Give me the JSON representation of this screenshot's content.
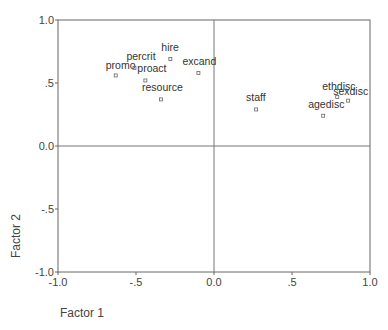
{
  "chart_data": {
    "type": "scatter",
    "title": "",
    "xlabel": "Factor 1",
    "ylabel": "Factor 2",
    "xlim": [
      -1.0,
      1.0
    ],
    "ylim": [
      -1.0,
      1.0
    ],
    "x_ticks": [
      {
        "value": -1.0,
        "label": "-1.0"
      },
      {
        "value": -0.5,
        "label": "-.5"
      },
      {
        "value": 0.0,
        "label": "0.0"
      },
      {
        "value": 0.5,
        "label": ".5"
      },
      {
        "value": 1.0,
        "label": "1.0"
      }
    ],
    "y_ticks": [
      {
        "value": 1.0,
        "label": "1.0"
      },
      {
        "value": 0.5,
        "label": ".5"
      },
      {
        "value": 0.0,
        "label": "0.0"
      },
      {
        "value": -0.5,
        "label": "-.5"
      },
      {
        "value": -1.0,
        "label": "-1.0"
      }
    ],
    "grid": false,
    "reference_lines": {
      "x": 0.0,
      "y": 0.0
    },
    "legend": null,
    "points": [
      {
        "label": "promo",
        "x": -0.63,
        "y": 0.56,
        "dx": -10,
        "dy": -6
      },
      {
        "label": "percrit",
        "x": -0.51,
        "y": 0.62,
        "dx": -8,
        "dy": -8
      },
      {
        "label": "proact",
        "x": -0.44,
        "y": 0.52,
        "dx": -8,
        "dy": -8
      },
      {
        "label": "hire",
        "x": -0.28,
        "y": 0.69,
        "dx": -9,
        "dy": -8
      },
      {
        "label": "excand",
        "x": -0.1,
        "y": 0.58,
        "dx": -16,
        "dy": -8
      },
      {
        "label": "resource",
        "x": -0.34,
        "y": 0.37,
        "dx": -19,
        "dy": -8
      },
      {
        "label": "staff",
        "x": 0.27,
        "y": 0.29,
        "dx": -10,
        "dy": -8
      },
      {
        "label": "ethdisc",
        "x": 0.79,
        "y": 0.39,
        "dx": -15,
        "dy": -7
      },
      {
        "label": "sexdisc",
        "x": 0.86,
        "y": 0.36,
        "dx": -15,
        "dy": -6
      },
      {
        "label": "agedisc",
        "x": 0.7,
        "y": 0.24,
        "dx": -15,
        "dy": -8
      }
    ]
  }
}
